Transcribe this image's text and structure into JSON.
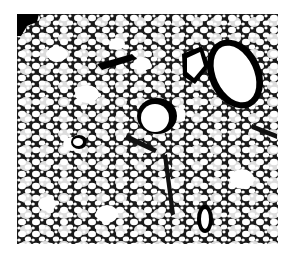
{
  "image": {
    "subject": "grayscale histology micrograph of lung tissue (alveoli with airways/vessels)",
    "colors": {
      "tissue": "#111111",
      "airspace": "#ffffff",
      "background": "#ffffff"
    }
  }
}
